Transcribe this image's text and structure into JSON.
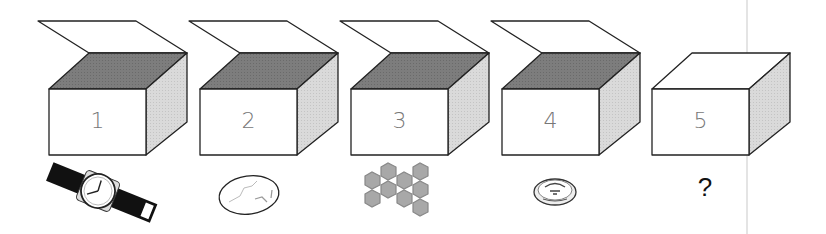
{
  "puzzle": {
    "boxes": [
      {
        "label": "1",
        "open": true,
        "item": "wristwatch"
      },
      {
        "label": "2",
        "open": true,
        "item": "stone"
      },
      {
        "label": "3",
        "open": true,
        "item": "honeycomb"
      },
      {
        "label": "4",
        "open": true,
        "item": "coin"
      },
      {
        "label": "5",
        "open": false,
        "item": "unknown"
      }
    ],
    "question_mark": "?"
  },
  "colors": {
    "outline": "#222222",
    "top_dark": "#7a7a7a",
    "side_light": "#d8d8d8",
    "hex_fill": "#a8a8a8"
  }
}
